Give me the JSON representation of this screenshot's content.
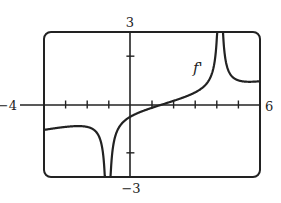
{
  "chart_data": {
    "type": "line",
    "title": "",
    "xlabel": "",
    "ylabel": "",
    "xlim": [
      -4,
      6
    ],
    "ylim": [
      -3,
      3
    ],
    "x_tick_step": 1,
    "y_tick_step": 2,
    "grid": false,
    "axis_labels": {
      "xmin": "−4",
      "xmax": "6",
      "ymax": "3",
      "ymin": "−3"
    },
    "series": [
      {
        "name": "f'",
        "vertical_asymptotes": [
          -1,
          4
        ],
        "x": [
          -4,
          -3,
          -2,
          -1.5,
          -1.2,
          -0.8,
          -0.5,
          0,
          1,
          1.5,
          2,
          3,
          3.5,
          3.8,
          4.2,
          4.5,
          5,
          6
        ],
        "y": [
          -0.5,
          -0.6,
          -0.9,
          -1.4,
          -2.5,
          -1.3,
          -0.7,
          -0.35,
          -0.05,
          0,
          0.1,
          0.5,
          1.0,
          2.2,
          2.2,
          1.4,
          1.0,
          0.7
        ]
      }
    ],
    "annotations": [
      {
        "text": "f'",
        "x": 2.8,
        "y": 1.7
      }
    ]
  }
}
